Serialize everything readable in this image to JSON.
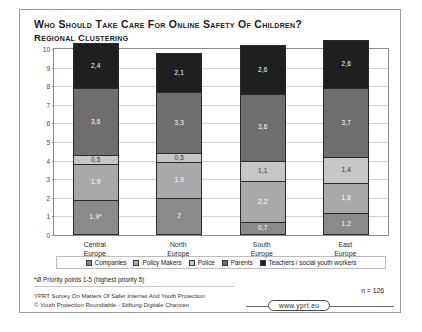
{
  "slide": {
    "title": "Who Should Take Care For Online Safety Of Children?",
    "subtitle": "Regional Clustering",
    "footnote": "*Ø Priority points 1-5 (highest priority 5)",
    "credit_line_1": "YPRT Survey On Matters Of Safer Internet And Youth Protection",
    "credit_line_2": "© Youth Protection Roundtable - Stiftung Digitale Chancen",
    "sample_size": "n = 126",
    "url_badge": "www.yprt.eu"
  },
  "chart_data": {
    "type": "bar",
    "stacked": true,
    "title": "Who Should Take Care For Online Safety Of Children?",
    "subtitle": "Regional Clustering",
    "xlabel": "",
    "ylabel": "",
    "ylim": [
      0,
      10
    ],
    "yticks": [
      0,
      1,
      2,
      3,
      4,
      5,
      6,
      7,
      8,
      9,
      10
    ],
    "grid": true,
    "legend_position": "bottom",
    "categories": [
      "Central Europe",
      "North Europe",
      "South Europe",
      "East Europe"
    ],
    "category_lines": [
      [
        "Central",
        "Europe"
      ],
      [
        "North",
        "Europe"
      ],
      [
        "South",
        "Europe"
      ],
      [
        "East",
        "Europe"
      ]
    ],
    "series": [
      {
        "name": "Companies",
        "color": "#8a8a8a",
        "text_color": "#ffffff",
        "values": [
          1.9,
          2.0,
          0.7,
          1.2
        ],
        "labels": [
          "1,9*",
          "2",
          "0,7",
          "1,2"
        ]
      },
      {
        "name": "Policy Makers",
        "color": "#a9a9a9",
        "text_color": "#ffffff",
        "values": [
          1.9,
          1.9,
          2.2,
          1.6
        ],
        "labels": [
          "1,9",
          "1,9",
          "2,2",
          "1,6"
        ]
      },
      {
        "name": "Police",
        "color": "#c6c6c6",
        "text_color": "#3a3a3a",
        "values": [
          0.5,
          0.5,
          1.1,
          1.4
        ],
        "labels": [
          "0,5",
          "0,5",
          "1,1",
          "1,4"
        ]
      },
      {
        "name": "Parents",
        "color": "#6e6e6e",
        "text_color": "#ffffff",
        "values": [
          3.6,
          3.3,
          3.6,
          3.7
        ],
        "labels": [
          "3,6",
          "3,3",
          "3,6",
          "3,7"
        ]
      },
      {
        "name": "Teachers / social youth workers",
        "color": "#1f1f1f",
        "text_color": "#ffffff",
        "values": [
          2.4,
          2.1,
          2.6,
          2.6
        ],
        "labels": [
          "2,4",
          "2,1",
          "2,6",
          "2,6"
        ]
      }
    ]
  }
}
